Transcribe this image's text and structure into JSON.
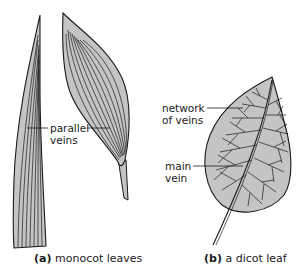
{
  "figure": {
    "panels": [
      {
        "id": "a",
        "caption_letter": "(a)",
        "caption_text": "monocot leaves",
        "labels": [
          {
            "line1": "parallel",
            "line2": "veins"
          }
        ]
      },
      {
        "id": "b",
        "caption_letter": "(b)",
        "caption_text": "a dicot leaf",
        "labels": [
          {
            "line1": "network",
            "line2": "of veins"
          },
          {
            "line1": "main",
            "line2": "vein"
          }
        ]
      }
    ],
    "colors": {
      "leaf_fill": "#c4c4c4",
      "outline": "#1a1a1a",
      "background": "#ffffff"
    }
  }
}
